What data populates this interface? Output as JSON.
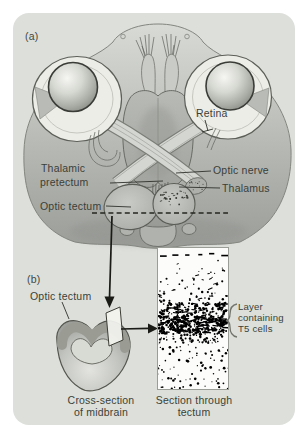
{
  "colors": {
    "page_bg": "#ffffff",
    "panel_bg": "#dcdfda",
    "text": "#3b3f37",
    "ink": "#1a1b17",
    "head": "#b9bbb7",
    "eye_ring": "#ecede7",
    "speckle": "#10110"
  },
  "panel_a": {
    "label": "(a)",
    "annotations": {
      "retina": "Retina",
      "thalamic_pretectum": [
        "Thalamic",
        "pretectum"
      ],
      "optic_nerve": "Optic nerve",
      "thalamus": "Thalamus",
      "optic_tectum": "Optic tectum"
    }
  },
  "panel_b": {
    "label": "(b)",
    "annotations": {
      "optic_tectum": "Optic tectum",
      "t5_layer": [
        "Layer",
        "containing",
        "T5 cells"
      ]
    },
    "captions": {
      "cross_section": [
        "Cross-section",
        "of midbrain"
      ],
      "section": [
        "Section through",
        "tectum"
      ]
    }
  }
}
